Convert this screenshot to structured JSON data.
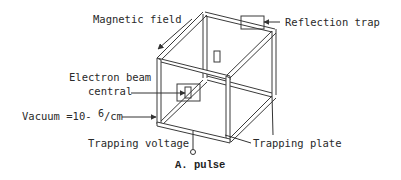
{
  "diagram": {
    "labels": {
      "magnetic_field": "Magnetic field",
      "reflection_trap": "Reflection trap",
      "electron_beam_line1": "Electron beam",
      "electron_beam_line2": "central",
      "vacuum_prefix": "Vacuum =10-",
      "vacuum_exponent": "6",
      "vacuum_suffix": "/cm",
      "trapping_voltage": "Trapping voltage",
      "trapping_plate": "Trapping plate"
    },
    "caption": "A. pulse",
    "colors": {
      "line": "#3a3a3a",
      "frame_fill": "#ffffff",
      "text": "#2a2a2a"
    }
  }
}
